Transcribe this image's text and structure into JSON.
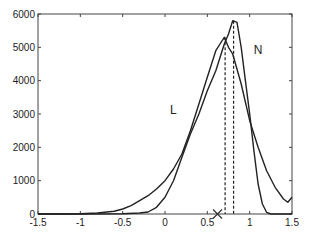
{
  "chart_data": {
    "type": "line",
    "title": "",
    "xlabel": "",
    "ylabel": "",
    "xlim": [
      -1.5,
      1.5
    ],
    "ylim": [
      0,
      6000
    ],
    "grid": false,
    "xticks": [
      -1.5,
      -1,
      -0.5,
      0,
      0.5,
      1,
      1.5
    ],
    "xtick_labels": [
      "-1.5",
      "-1",
      "-0.5",
      "0",
      "0.5",
      "1",
      "1.5"
    ],
    "yticks": [
      0,
      1000,
      2000,
      3000,
      4000,
      5000,
      6000
    ],
    "ytick_labels": [
      "0",
      "1000",
      "2000",
      "3000",
      "4000",
      "5000",
      "6000"
    ],
    "series": [
      {
        "name": "L",
        "x": [
          -1.5,
          -1.2,
          -1.0,
          -0.8,
          -0.6,
          -0.5,
          -0.4,
          -0.3,
          -0.2,
          -0.1,
          0.0,
          0.1,
          0.2,
          0.3,
          0.4,
          0.5,
          0.6,
          0.65,
          0.7,
          0.75,
          0.8,
          0.9,
          1.0,
          1.1,
          1.2,
          1.3,
          1.4,
          1.45,
          1.5
        ],
        "y": [
          0,
          0,
          10,
          30,
          80,
          150,
          250,
          400,
          550,
          750,
          1000,
          1350,
          1800,
          2500,
          3300,
          4100,
          4900,
          5100,
          5300,
          5000,
          4800,
          3900,
          2800,
          2000,
          1300,
          800,
          450,
          350,
          500
        ]
      },
      {
        "name": "N",
        "x": [
          -1.5,
          -1.0,
          -0.5,
          -0.3,
          -0.2,
          -0.1,
          0.0,
          0.1,
          0.2,
          0.3,
          0.4,
          0.5,
          0.6,
          0.7,
          0.75,
          0.8,
          0.85,
          0.9,
          0.95,
          1.0,
          1.05,
          1.1,
          1.15,
          1.2,
          1.25,
          1.3,
          1.5
        ],
        "y": [
          0,
          0,
          10,
          30,
          60,
          200,
          500,
          1000,
          1700,
          2400,
          3000,
          3700,
          4300,
          5100,
          5400,
          5800,
          5750,
          5000,
          4000,
          3000,
          1900,
          900,
          300,
          50,
          0,
          0,
          0
        ]
      }
    ],
    "annotations": [
      {
        "type": "text",
        "text": "L",
        "x": 0.1,
        "y": 3000
      },
      {
        "type": "text",
        "text": "N",
        "x": 1.1,
        "y": 4800
      },
      {
        "type": "vline",
        "style": "dashed",
        "x": 0.71,
        "y_top": 5300
      },
      {
        "type": "vline",
        "style": "dashed",
        "x": 0.81,
        "y_top": 5800
      },
      {
        "type": "marker",
        "symbol": "x",
        "x": 0.62,
        "y": 0
      }
    ]
  }
}
